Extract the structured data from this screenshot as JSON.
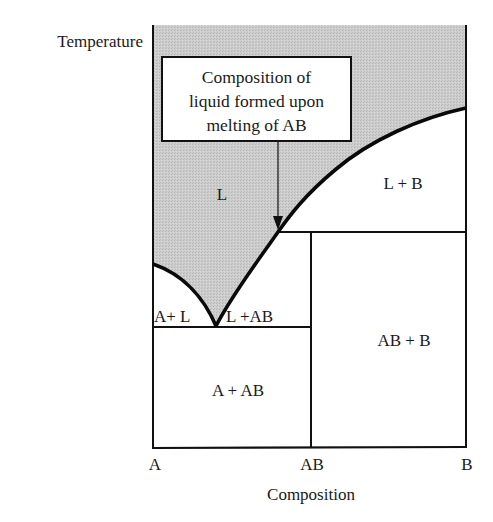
{
  "diagram": {
    "y_axis_label": "Temperature",
    "x_axis_label": "Composition",
    "x_ticks": [
      "A",
      "AB",
      "B"
    ],
    "regions": {
      "liquid": "L",
      "liquid_plus_b": "L + B",
      "a_plus_liquid": "A+ L",
      "liquid_plus_ab": "L +AB",
      "ab_plus_b": "AB + B",
      "a_plus_ab": "A + AB"
    },
    "annotation": {
      "lines": [
        "Composition of",
        "liquid formed upon",
        "melting of AB"
      ]
    },
    "colors": {
      "liquid_fill": "#c9c9c9",
      "line": "#111111",
      "background": "#ffffff"
    }
  }
}
